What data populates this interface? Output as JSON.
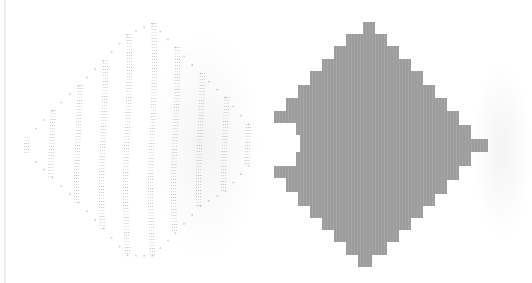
{
  "figure": {
    "colors": {
      "background": "#ffffff",
      "dots": "#9a9a9a",
      "diamond_fill": "#9c9c9c",
      "edge_line": "#ececec"
    },
    "left_pattern": {
      "kind": "dotted-columns",
      "columns": [
        {
          "x": 27,
          "top": 137,
          "bottom": 153
        },
        {
          "x": 52,
          "top": 110,
          "bottom": 177
        },
        {
          "x": 78,
          "top": 85,
          "bottom": 202
        },
        {
          "x": 103,
          "top": 60,
          "bottom": 228
        },
        {
          "x": 127,
          "top": 34,
          "bottom": 255
        },
        {
          "x": 152,
          "top": 23,
          "bottom": 255
        },
        {
          "x": 175,
          "top": 47,
          "bottom": 232
        },
        {
          "x": 200,
          "top": 73,
          "bottom": 205
        },
        {
          "x": 225,
          "top": 97,
          "bottom": 190
        },
        {
          "x": 248,
          "top": 124,
          "bottom": 165
        }
      ]
    },
    "right_pattern": {
      "kind": "filled-staircase-diamond",
      "polygon": "363,22 375,22 375,34 387,34 387,46 399,46 399,59 411,59 411,71 423,71 423,85 435,85 435,98 447,98 447,111 459,111 459,125 471,125 471,139 488,139 488,152 471,152 471,166 459,166 459,180 447,180 447,194 435,194 435,206 423,206 423,218 411,218 411,230 399,230 399,242 387,242 387,255 372,255 372,267 358,267 358,255 346,255 346,242 334,242 334,230 322,230 322,218 310,218 310,206 298,206 298,192 286,192 286,178 274,178 274,166 296,166 296,152 300,152 300,135 296,135 296,123 274,123 274,111 286,111 286,98 298,98 298,85 310,85 310,71 322,71 322,59 334,59 334,46 346,46 346,34 363,34"
    }
  }
}
